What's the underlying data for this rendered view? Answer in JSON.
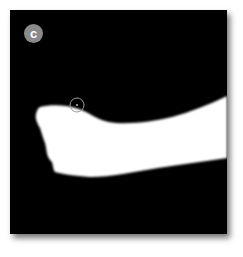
{
  "figure": {
    "panel_label": "c",
    "background_color": "#000000",
    "foreground_color": "#ffffff",
    "badge_color": "#8a8a8a",
    "marker": {
      "shape": "circle",
      "cx": 77,
      "cy": 105,
      "r": 7,
      "stroke": "#9a9a9a"
    }
  }
}
